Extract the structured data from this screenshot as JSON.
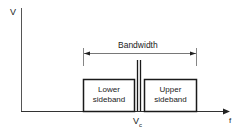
{
  "diagram": {
    "axes": {
      "y_label": "V",
      "x_label": "f"
    },
    "bandwidth_label": "Bandwidth",
    "carrier_label": "V",
    "carrier_subscript": "c",
    "lower_sideband": {
      "line1": "Lower",
      "line2": "sideband"
    },
    "upper_sideband": {
      "line1": "Upper",
      "line2": "sideband"
    },
    "colors": {
      "stroke": "#1a1a1a",
      "axis": "#444444",
      "background": "#ffffff"
    }
  }
}
